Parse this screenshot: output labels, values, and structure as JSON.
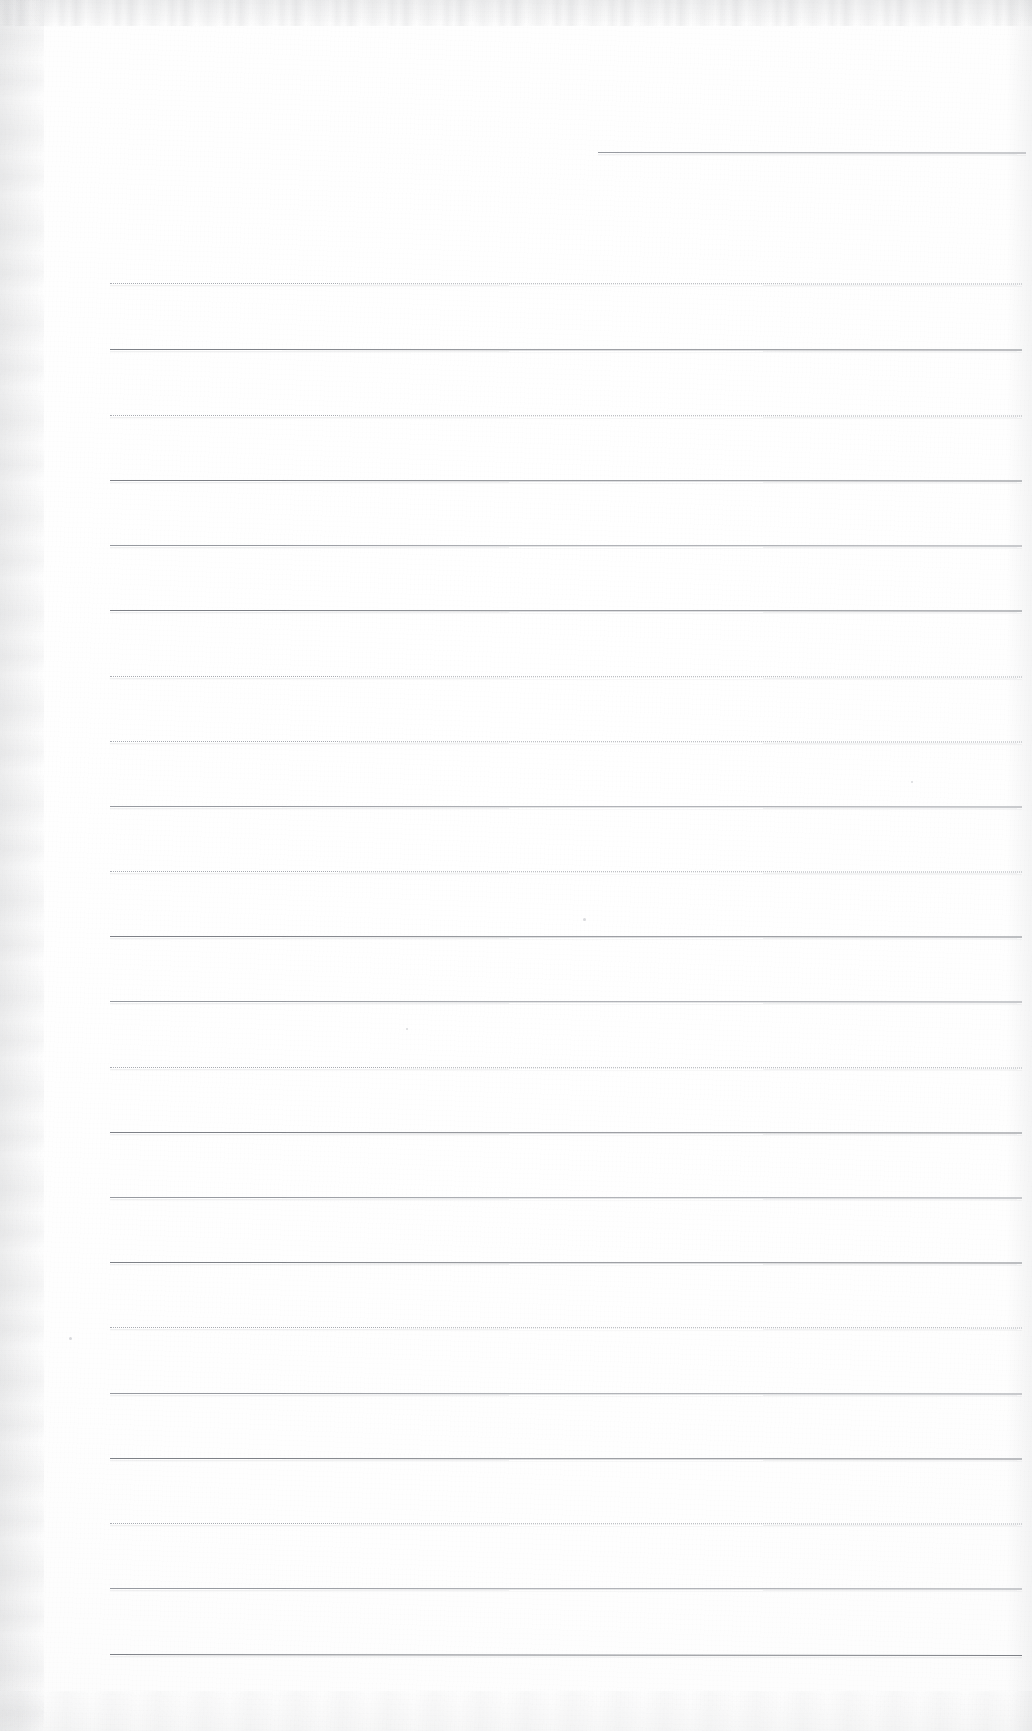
{
  "document": {
    "kind": "scanned-lined-paper",
    "title": "Blank ruled notebook page (scan)",
    "page_width": 1032,
    "page_height": 1731,
    "background_color": "#ffffff",
    "rule_color": "#8d9096",
    "rule_color_faint": "#a9acb2",
    "has_text": false,
    "has_handwriting": false,
    "visible_text": ""
  },
  "paper": {
    "margin_left_px": 110,
    "margin_right_px": 1022,
    "line_spacing_px": 65,
    "total_rules": 23,
    "notes": "One short isolated rule near the top right; 22 full-width rules below."
  },
  "rules": [
    {
      "id": "rule-top-short",
      "y": 152,
      "x_start": 598,
      "x_end": 1026,
      "weight": "mid",
      "slope": 0.6
    },
    {
      "id": "rule-01",
      "y": 283,
      "x_start": 110,
      "x_end": 1022,
      "weight": "faint",
      "slope": 0.5
    },
    {
      "id": "rule-02",
      "y": 349,
      "x_start": 110,
      "x_end": 1022,
      "weight": "dark",
      "slope": 0.4
    },
    {
      "id": "rule-03",
      "y": 415,
      "x_start": 110,
      "x_end": 1022,
      "weight": "faint",
      "slope": 0.5
    },
    {
      "id": "rule-04",
      "y": 480,
      "x_start": 110,
      "x_end": 1022,
      "weight": "dark",
      "slope": 0.4
    },
    {
      "id": "rule-05",
      "y": 545,
      "x_start": 110,
      "x_end": 1022,
      "weight": "mid",
      "slope": 0.5
    },
    {
      "id": "rule-06",
      "y": 610,
      "x_start": 110,
      "x_end": 1022,
      "weight": "dark",
      "slope": 0.4
    },
    {
      "id": "rule-07",
      "y": 676,
      "x_start": 110,
      "x_end": 1022,
      "weight": "faint",
      "slope": 0.5
    },
    {
      "id": "rule-08",
      "y": 741,
      "x_start": 110,
      "x_end": 1022,
      "weight": "faint",
      "slope": 0.5
    },
    {
      "id": "rule-09",
      "y": 806,
      "x_start": 110,
      "x_end": 1022,
      "weight": "mid",
      "slope": 0.4
    },
    {
      "id": "rule-10",
      "y": 871,
      "x_start": 110,
      "x_end": 1022,
      "weight": "faint",
      "slope": 0.5
    },
    {
      "id": "rule-11",
      "y": 936,
      "x_start": 110,
      "x_end": 1022,
      "weight": "dark",
      "slope": 0.4
    },
    {
      "id": "rule-12",
      "y": 1001,
      "x_start": 110,
      "x_end": 1022,
      "weight": "mid",
      "slope": 0.5
    },
    {
      "id": "rule-13",
      "y": 1067,
      "x_start": 110,
      "x_end": 1022,
      "weight": "faint",
      "slope": 0.4
    },
    {
      "id": "rule-14",
      "y": 1132,
      "x_start": 110,
      "x_end": 1022,
      "weight": "dark",
      "slope": 0.5
    },
    {
      "id": "rule-15",
      "y": 1197,
      "x_start": 110,
      "x_end": 1022,
      "weight": "mid",
      "slope": 0.4
    },
    {
      "id": "rule-16",
      "y": 1262,
      "x_start": 110,
      "x_end": 1022,
      "weight": "dark",
      "slope": 0.5
    },
    {
      "id": "rule-17",
      "y": 1327,
      "x_start": 110,
      "x_end": 1022,
      "weight": "faint",
      "slope": 0.4
    },
    {
      "id": "rule-18",
      "y": 1393,
      "x_start": 110,
      "x_end": 1022,
      "weight": "mid",
      "slope": 0.5
    },
    {
      "id": "rule-19",
      "y": 1458,
      "x_start": 110,
      "x_end": 1022,
      "weight": "dark",
      "slope": 0.4
    },
    {
      "id": "rule-20",
      "y": 1523,
      "x_start": 110,
      "x_end": 1022,
      "weight": "faint",
      "slope": 0.5
    },
    {
      "id": "rule-21",
      "y": 1588,
      "x_start": 110,
      "x_end": 1022,
      "weight": "mid",
      "slope": 0.4
    },
    {
      "id": "rule-22",
      "y": 1654,
      "x_start": 110,
      "x_end": 1022,
      "weight": "dark",
      "slope": 1.1
    }
  ],
  "specks": [
    {
      "id": "speck-1",
      "x": 583,
      "y": 918,
      "size": 3
    },
    {
      "id": "speck-2",
      "x": 911,
      "y": 781,
      "size": 2
    },
    {
      "id": "speck-3",
      "x": 69,
      "y": 1337,
      "size": 3
    },
    {
      "id": "speck-4",
      "x": 406,
      "y": 1028,
      "size": 2
    }
  ]
}
